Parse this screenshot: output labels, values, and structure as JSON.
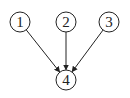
{
  "diagram": {
    "type": "directed-graph",
    "nodes": [
      {
        "id": "1",
        "label": "1",
        "cx": 20,
        "cy": 22,
        "r": 10
      },
      {
        "id": "2",
        "label": "2",
        "cx": 66,
        "cy": 22,
        "r": 10
      },
      {
        "id": "3",
        "label": "3",
        "cx": 109,
        "cy": 22,
        "r": 10
      },
      {
        "id": "4",
        "label": "4",
        "cx": 66,
        "cy": 80,
        "r": 10
      }
    ],
    "edges": [
      {
        "from": "1",
        "to": "4"
      },
      {
        "from": "2",
        "to": "4"
      },
      {
        "from": "3",
        "to": "4"
      }
    ],
    "colors": {
      "stroke": "#222222",
      "fill": "#ffffff"
    }
  }
}
